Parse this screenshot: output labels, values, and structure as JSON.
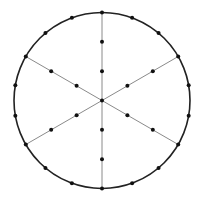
{
  "diagram": {
    "width": 200,
    "height": 198,
    "center": {
      "x": 102,
      "y": 100.5
    },
    "radius": 88,
    "colors": {
      "background": "#ffffff",
      "circle": "#222222",
      "spoke": "#8a8a8a",
      "dot": "#111111"
    },
    "circle_stroke_width": 1.6,
    "spoke_stroke_width": 1,
    "dot_radius": 2,
    "spokes": {
      "count": 6,
      "angles_deg": [
        90,
        150,
        210,
        270,
        330,
        30
      ],
      "dots_per_spoke_fractions": [
        0.3333,
        0.6667
      ]
    },
    "circumference_dots": {
      "count": 18,
      "start_angle_deg": 90,
      "step_deg": 20
    },
    "center_dot": true
  }
}
